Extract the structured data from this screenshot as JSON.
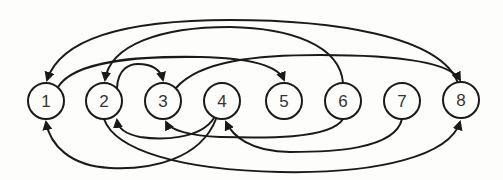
{
  "diagram": {
    "type": "directed-graph",
    "nodes": [
      {
        "id": "1",
        "label": "1",
        "x": 46,
        "y": 101
      },
      {
        "id": "2",
        "label": "2",
        "x": 104,
        "y": 101
      },
      {
        "id": "3",
        "label": "3",
        "x": 163,
        "y": 101
      },
      {
        "id": "4",
        "label": "4",
        "x": 222,
        "y": 101
      },
      {
        "id": "5",
        "label": "5",
        "x": 284,
        "y": 101
      },
      {
        "id": "6",
        "label": "6",
        "x": 343,
        "y": 101
      },
      {
        "id": "7",
        "label": "7",
        "x": 402,
        "y": 101
      },
      {
        "id": "8",
        "label": "8",
        "x": 461,
        "y": 100
      }
    ],
    "edges": [
      {
        "from": "8",
        "to": "1",
        "side": "top"
      },
      {
        "from": "6",
        "to": "2",
        "side": "top"
      },
      {
        "from": "1",
        "to": "5",
        "side": "top"
      },
      {
        "from": "2",
        "to": "3",
        "side": "top"
      },
      {
        "from": "3",
        "to": "8",
        "side": "top"
      },
      {
        "from": "4",
        "to": "2",
        "side": "bottom"
      },
      {
        "from": "6",
        "to": "3",
        "side": "bottom"
      },
      {
        "from": "7",
        "to": "4",
        "side": "bottom"
      },
      {
        "from": "4",
        "to": "1",
        "side": "bottom"
      },
      {
        "from": "2",
        "to": "8",
        "side": "bottom"
      }
    ]
  }
}
